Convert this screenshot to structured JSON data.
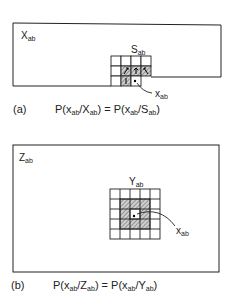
{
  "panel_a": {
    "tag": "(a)",
    "region_label": {
      "base": "X",
      "sub": "ab"
    },
    "window_label": {
      "base": "S",
      "sub": "ab"
    },
    "pixel_label": {
      "base": "x",
      "sub": "ab"
    },
    "equation": {
      "lhs_prefix": "P(x",
      "lhs_sub1": "ab",
      "lhs_mid": "/X",
      "lhs_sub2": "ab",
      "lhs_close": ")",
      "equals": " = ",
      "rhs_prefix": "P(x",
      "rhs_sub1": "ab",
      "rhs_mid": "/S",
      "rhs_sub2": "ab",
      "rhs_close": ")"
    },
    "grid": {
      "cols": 4,
      "rows": 3,
      "hatched_cells": [
        [
          1,
          1
        ],
        [
          1,
          2
        ],
        [
          1,
          3
        ],
        [
          2,
          1
        ]
      ],
      "current_cell": [
        2,
        2
      ]
    }
  },
  "panel_b": {
    "tag": "(b)",
    "region_label": {
      "base": "Z",
      "sub": "ab"
    },
    "window_label": {
      "base": "Y",
      "sub": "ab"
    },
    "pixel_label": {
      "base": "x",
      "sub": "ab"
    },
    "equation": {
      "lhs_prefix": "P(x",
      "lhs_sub1": "ab",
      "lhs_mid": "/Z",
      "lhs_sub2": "ab",
      "lhs_close": ")",
      "equals": " = ",
      "rhs_prefix": "P(x",
      "rhs_sub1": "ab",
      "rhs_mid": "/Y",
      "rhs_sub2": "ab",
      "rhs_close": ")"
    },
    "grid": {
      "cols": 5,
      "rows": 5,
      "hatched_cells": [
        [
          1,
          1
        ],
        [
          1,
          2
        ],
        [
          1,
          3
        ],
        [
          2,
          1
        ],
        [
          2,
          3
        ],
        [
          3,
          1
        ],
        [
          3,
          2
        ],
        [
          3,
          3
        ]
      ],
      "current_cell": [
        2,
        2
      ]
    }
  }
}
